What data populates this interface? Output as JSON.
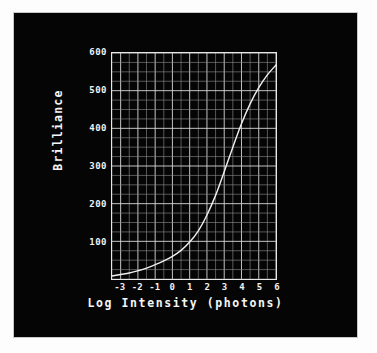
{
  "figure": {
    "background_color": "#050505",
    "ink_color": "#f2f2f2",
    "page_color": "#fdfdfd"
  },
  "chart_data": {
    "type": "line",
    "title": "",
    "xlabel": "Log Intensity (photons)",
    "ylabel": "Brilliance",
    "xlim": [
      -3.5,
      6.0
    ],
    "ylim": [
      0,
      600
    ],
    "xticks": [
      -3,
      -2,
      -1,
      0,
      1,
      2,
      3,
      4,
      5,
      6
    ],
    "xtick_labels": [
      "-3",
      "-2",
      "-1",
      "0",
      "1",
      "2",
      "3",
      "4",
      "5",
      "6"
    ],
    "yticks": [
      100,
      200,
      300,
      400,
      500,
      600
    ],
    "ytick_labels": [
      "100",
      "200",
      "300",
      "400",
      "500",
      "600"
    ],
    "grid": true,
    "grid_minor_divisions_x": 2,
    "grid_minor_divisions_y": 4,
    "legend": "none",
    "line_color": "#f0f0f0",
    "series": [
      {
        "name": "Brilliance response",
        "x": [
          -3.5,
          -3.0,
          -2.5,
          -2.0,
          -1.5,
          -1.0,
          -0.5,
          0.0,
          0.5,
          1.0,
          1.5,
          2.0,
          2.5,
          3.0,
          3.5,
          4.0,
          4.5,
          5.0,
          5.5,
          6.0
        ],
        "y": [
          8,
          12,
          16,
          22,
          29,
          38,
          48,
          60,
          76,
          98,
          128,
          170,
          222,
          285,
          350,
          412,
          465,
          508,
          542,
          568
        ]
      }
    ]
  },
  "axis": {
    "x_title": "Log Intensity (photons)",
    "y_title": "Brilliance"
  }
}
